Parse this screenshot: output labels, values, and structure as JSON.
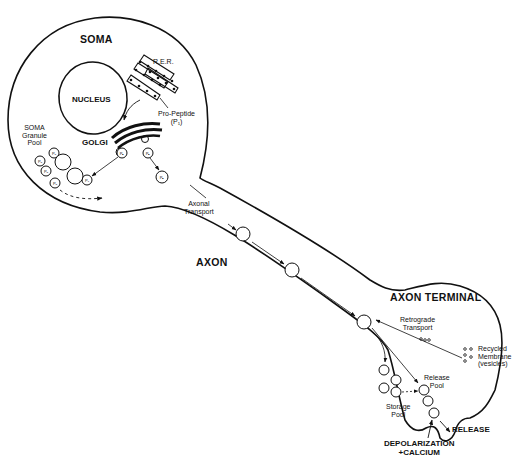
{
  "diagram": {
    "title_regions": {
      "soma": "SOMA",
      "axon": "AXON",
      "axon_terminal": "AXON TERMINAL"
    },
    "organelles": {
      "nucleus": "NUCLEUS",
      "rer": "R.E.R.",
      "golgi": "GOLGI",
      "pro_peptide_line1": "Pro-Peptide",
      "pro_peptide_line2": "(P₁)"
    },
    "pools": {
      "soma_granule_line1": "SOMA",
      "soma_granule_line2": "Granule",
      "soma_granule_line3": "Pool",
      "storage_line1": "Storage",
      "storage_line2": "Pool",
      "release_line1": "Release",
      "release_line2": "Pool"
    },
    "processes": {
      "axonal_transport_line1": "Axonal",
      "axonal_transport_line2": "Transport",
      "retrograde_line1": "Retrograde",
      "retrograde_line2": "Transport",
      "recycled_line1": "Recycled",
      "recycled_line2": "Membrane",
      "recycled_line3": "(vesicles)",
      "release": "RELEASE",
      "depolarization_line1": "DEPOLARIZATION",
      "depolarization_line2": "+CALCIUM"
    },
    "vesicle_labels": {
      "p1": "P₁",
      "pn": "Pₙ",
      "pa": "Pₐ"
    },
    "colors": {
      "ink": "#111111",
      "background": "#ffffff"
    }
  }
}
